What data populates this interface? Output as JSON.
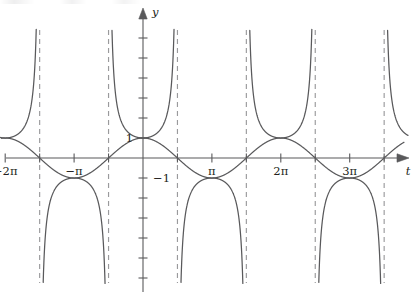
{
  "figure": {
    "title": "",
    "axis_labels": {
      "x": "t",
      "y": "y"
    }
  },
  "chart_data": {
    "type": "line",
    "title": "",
    "xlabel": "t",
    "ylabel": "y",
    "xlim": [
      -6.2832,
      12.5664
    ],
    "ylim": [
      -7.0,
      7.0
    ],
    "grid": false,
    "legend": "none",
    "x_tick_labels": [
      "-2π",
      "-π",
      "π",
      "2π",
      "3π",
      "4π"
    ],
    "x_tick_values": [
      -6.2832,
      -3.1416,
      3.1416,
      6.2832,
      9.4248,
      12.5664
    ],
    "x_minor_tick_values": [
      -4.7124,
      -1.5708,
      1.5708,
      4.7124,
      7.854,
      10.9956
    ],
    "y_tick_labels": [
      "1",
      "-1"
    ],
    "y_tick_values": [
      1,
      -1
    ],
    "y_minor_tick_values": [
      -6,
      -5,
      -4,
      -3,
      -2,
      2,
      3,
      4,
      5,
      6,
      7
    ],
    "series": [
      {
        "name": "y = sec t",
        "expression": "sec(t)",
        "style": "solid",
        "color": "#59595b",
        "period": 6.2832,
        "branch_minima": [
          1,
          1,
          1,
          1
        ],
        "branch_maxima": [
          -1,
          -1,
          -1
        ]
      },
      {
        "name": "y = cos t",
        "expression": "cos(t)",
        "style": "solid",
        "color": "#59595b",
        "amplitude": 1,
        "period": 6.2832,
        "zeros": [
          -4.7124,
          -1.5708,
          1.5708,
          4.7124,
          7.854,
          10.9956
        ],
        "maxima_t": [
          -6.2832,
          0,
          6.2832,
          12.5664
        ],
        "minima_t": [
          -3.1416,
          3.1416,
          9.4248
        ]
      }
    ],
    "asymptotes": {
      "type": "vertical",
      "style": "dashed",
      "color": "#9a9a9c",
      "values": [
        -4.7124,
        -1.5708,
        1.5708,
        4.7124,
        7.854,
        10.9956
      ],
      "labels": [
        "-3π/2",
        "-π/2",
        "π/2",
        "3π/2",
        "5π/2",
        "7π/2"
      ]
    },
    "annotations": []
  },
  "labels": {
    "x": [
      {
        "text": "−2π",
        "value": -6.2832
      },
      {
        "text": "−π",
        "value": -3.1416
      },
      {
        "text": "π",
        "value": 3.1416
      },
      {
        "text": "2π",
        "value": 6.2832
      },
      {
        "text": "3π",
        "value": 9.4248
      },
      {
        "text": "4π",
        "value": 12.5664
      }
    ],
    "y": [
      {
        "text": "1",
        "value": 1
      },
      {
        "text": "−1",
        "value": -1
      }
    ],
    "axis_x_name": "t",
    "axis_y_name": "y"
  },
  "colors": {
    "curve": "#59595b",
    "axis": "#59595b",
    "asymptote": "#9a9a9c",
    "text": "#231f20",
    "background": "#ffffff"
  }
}
